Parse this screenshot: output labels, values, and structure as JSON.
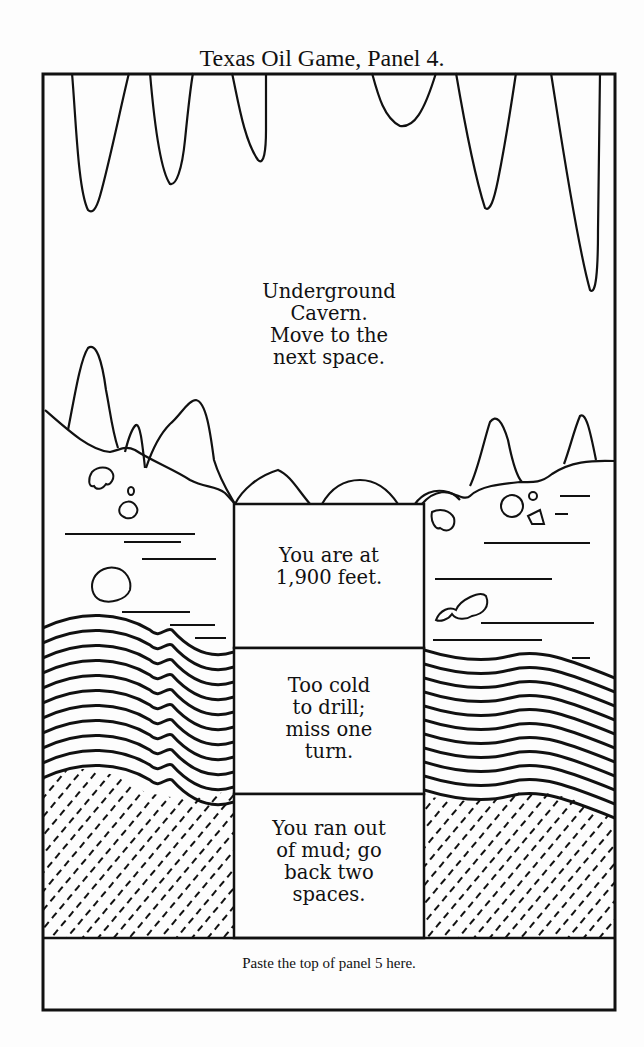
{
  "title": "Texas Oil Game, Panel 4.",
  "spaces": [
    {
      "id": "cavern",
      "label": "Underground\nCavern.\nMove to the\nnext space."
    },
    {
      "id": "depth",
      "label": "You are at\n1,900 feet."
    },
    {
      "id": "cold",
      "label": "Too cold\nto drill;\nmiss one\nturn."
    },
    {
      "id": "mud",
      "label": "You ran out\nof mud; go\nback two\nspaces."
    }
  ],
  "footer": {
    "paste_instruction": "Paste the top of panel 5 here."
  },
  "colors": {
    "ink": "#111111",
    "paper": "#fdfdfd"
  }
}
